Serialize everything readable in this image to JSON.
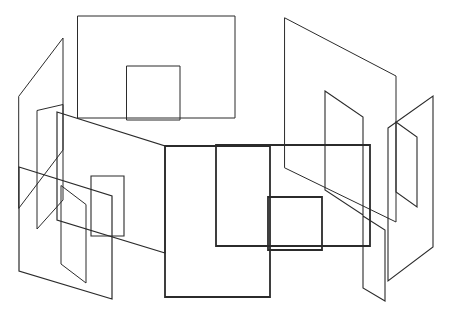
{
  "document": {
    "title": "Abstract Line Drawing",
    "kind": "line-art-illustration",
    "width": 450,
    "height": 310,
    "background_color": "#ffffff"
  },
  "style": {
    "stroke_color_dark": "#2b2b2b",
    "stroke_color_mid": "#3a3a3a",
    "stroke_color_light": "#565656",
    "stroke_width_thin": 1,
    "stroke_width_medium": 1.4,
    "stroke_width_thick": 2
  },
  "figure": {
    "shapes": [
      {
        "id": "plane-left-far",
        "name": "left-far-parallelogram",
        "type": "polygon",
        "points": "19,96 63,38 63,150 19,208",
        "stroke": "#565656",
        "width": 1
      },
      {
        "id": "plane-left-inner-tall",
        "name": "left-inner-tall-parallelogram",
        "type": "polygon",
        "points": "37,111 37,229 63,200 63,105",
        "stroke": "#565656",
        "width": 1
      },
      {
        "id": "rect-upper-large",
        "name": "upper-large-rectangle",
        "type": "polygon",
        "points": "78,16 235,16 235,118 78,118",
        "stroke": "#565656",
        "width": 1
      },
      {
        "id": "rect-upper-inner",
        "name": "upper-inner-rectangle",
        "type": "polygon",
        "points": "127,66 180,66 180,120 127,120",
        "stroke": "#565656",
        "width": 1
      },
      {
        "id": "plane-left-big",
        "name": "left-big-parallelogram",
        "type": "polygon",
        "points": "57,112 165,146 165,253 57,220",
        "stroke": "#3a3a3a",
        "width": 1.2
      },
      {
        "id": "plane-left-bottom",
        "name": "left-bottom-parallelogram",
        "type": "polygon",
        "points": "19,167 19,271 112,299 112,196",
        "stroke": "#3a3a3a",
        "width": 1.2
      },
      {
        "id": "plane-left-small",
        "name": "left-small-parallelogram",
        "type": "polygon",
        "points": "61,186 61,264 86,283 86,205",
        "stroke": "#565656",
        "width": 1
      },
      {
        "id": "plane-mid-left-small",
        "name": "mid-left-small-parallelogram",
        "type": "polygon",
        "points": "91,176 124,176 124,236 91,236",
        "stroke": "#3a3a3a",
        "width": 1.1
      },
      {
        "id": "rect-bottom-left-big",
        "name": "bottom-left-big-rectangle",
        "type": "polygon",
        "points": "165,146 270,146 270,297 165,297",
        "stroke": "#2b2b2b",
        "width": 1.8
      },
      {
        "id": "rect-middle",
        "name": "middle-rectangle",
        "type": "polygon",
        "points": "216,145 370,145 370,246 216,246",
        "stroke": "#2b2b2b",
        "width": 1.8
      },
      {
        "id": "rect-middle-inner",
        "name": "middle-inner-rectangle",
        "type": "polygon",
        "points": "268,197 322,197 322,250 268,250",
        "stroke": "#2b2b2b",
        "width": 1.8
      },
      {
        "id": "plane-right-big",
        "name": "right-big-parallelogram",
        "type": "polygon",
        "points": "285,18 396,76 396,222 285,168",
        "stroke": "#565656",
        "width": 1
      },
      {
        "id": "plane-right-mid",
        "name": "right-mid-parallelogram",
        "type": "polygon",
        "points": "325,91 363,117 363,215 325,190",
        "stroke": "#3a3a3a",
        "width": 1.1
      },
      {
        "id": "plane-right-tall",
        "name": "right-tall-parallelogram",
        "type": "polygon",
        "points": "388,128 433,96 433,247 388,281",
        "stroke": "#3a3a3a",
        "width": 1.1
      },
      {
        "id": "plane-right-inner",
        "name": "right-inner-parallelogram",
        "type": "polygon",
        "points": "396,122 417,137 417,207 396,192",
        "stroke": "#3a3a3a",
        "width": 1.1
      },
      {
        "id": "plane-right-lower",
        "name": "right-lower-parallelogram",
        "type": "polygon",
        "points": "363,216 385,230 385,301 363,288",
        "stroke": "#3a3a3a",
        "width": 1.1
      }
    ]
  }
}
